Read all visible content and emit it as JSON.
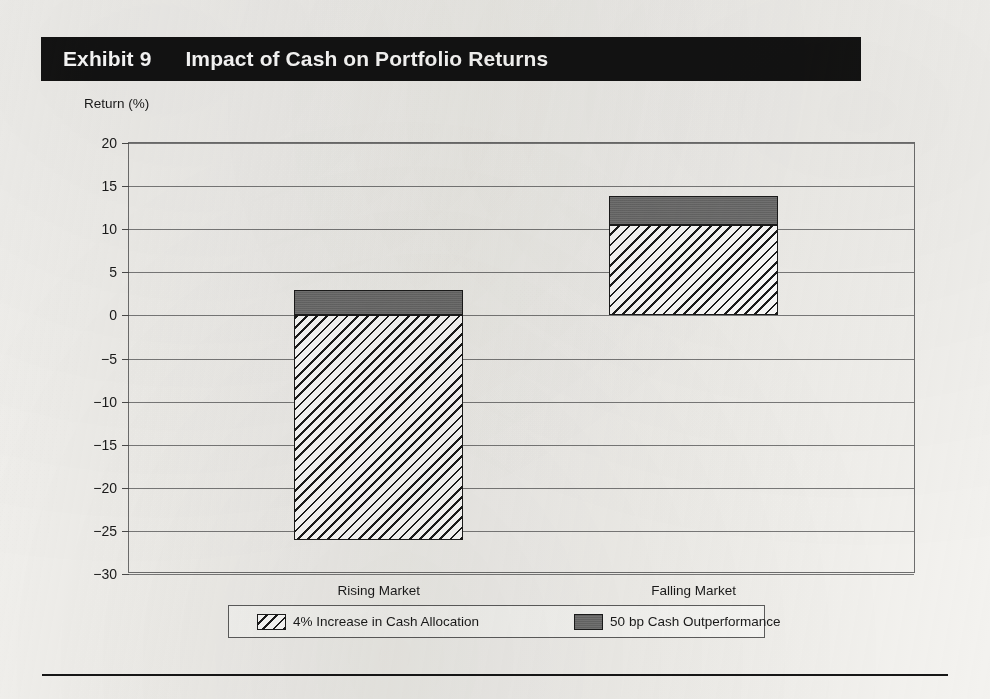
{
  "exhibit": {
    "number_label": "Exhibit 9",
    "title": "Impact of Cash on Portfolio Returns"
  },
  "chart_data": {
    "type": "bar",
    "title": "Impact of Cash on Portfolio Returns",
    "subtitle": "",
    "xlabel": "",
    "ylabel": "Return (%)",
    "categories": [
      "Rising Market",
      "Falling Market"
    ],
    "series": [
      {
        "name": "4% Increase in Cash Allocation",
        "fill": "diagonal-hatch",
        "values": [
          -26.0,
          10.5
        ]
      },
      {
        "name": "50 bp Cash Outperformance",
        "fill": "solid-gray",
        "color": "#6c6c6c",
        "values": [
          3.0,
          3.3
        ]
      }
    ],
    "stacked": true,
    "stack_totals": [
      -23.0,
      13.8
    ],
    "ylim": [
      -30,
      20
    ],
    "ytick_step": 5,
    "yticks": [
      "20",
      "15",
      "10",
      "5",
      "0",
      "-5",
      "-10",
      "-15",
      "-20",
      "-25",
      "-30"
    ],
    "ytick_values": [
      20,
      15,
      10,
      5,
      0,
      -5,
      -10,
      -15,
      -20,
      -25,
      -30
    ],
    "grid": true,
    "grid_axis": "y",
    "legend_position": "bottom",
    "legend": [
      "4% Increase in Cash Allocation",
      "50 bp Cash Outperformance"
    ]
  },
  "colors": {
    "title_bar_bg": "#131313",
    "title_bar_text": "#ffffff",
    "hatch_stroke": "#1b1b1b",
    "solid_segment": "#6c6c6c",
    "gridline": "#7a7a7a",
    "plot_border": "#6e6e6e",
    "page_bg": "#f3f2ef"
  }
}
